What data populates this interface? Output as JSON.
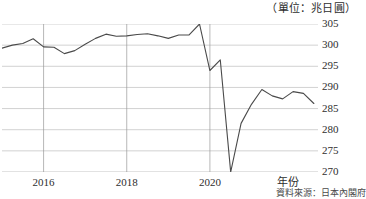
{
  "caption": {
    "unit": "（單位：兆日圓）",
    "source": "資料來源：日本內閣府"
  },
  "axis": {
    "x_name": "年份",
    "y_ticks": [
      "305",
      "300",
      "295",
      "290",
      "285",
      "280",
      "275",
      "270"
    ],
    "x_ticks": [
      "2016",
      "2018",
      "2020"
    ]
  },
  "colors": {
    "line": "#4a4a4a",
    "grid": "#bdbdbd",
    "axis": "#9a9a9a",
    "text": "#2e2e2e",
    "background": "#ffffff"
  },
  "chart_data": {
    "type": "line",
    "title": "",
    "subtitle": "",
    "xlabel": "年份",
    "ylabel": "兆日圓",
    "unit": "兆日圓",
    "source": "資料來源：日本內閣府",
    "grid": true,
    "legend": "none",
    "xlim": [
      2015.0,
      2022.6
    ],
    "ylim": [
      270,
      305
    ],
    "ytick_values": [
      270,
      275,
      280,
      285,
      290,
      295,
      300,
      305
    ],
    "xtick_values": [
      2016,
      2018,
      2020
    ],
    "x_tick_labels": [
      "2016",
      "2018",
      "2020"
    ],
    "series": [
      {
        "name": "名目GDP",
        "color": "#4a4a4a",
        "x": [
          2015.0,
          2015.25,
          2015.5,
          2015.75,
          2016.0,
          2016.25,
          2016.5,
          2016.75,
          2017.0,
          2017.25,
          2017.5,
          2017.75,
          2018.0,
          2018.25,
          2018.5,
          2018.75,
          2019.0,
          2019.25,
          2019.5,
          2019.75,
          2020.0,
          2020.25,
          2020.5,
          2020.75,
          2021.0,
          2021.25,
          2021.5,
          2021.75,
          2022.0,
          2022.25,
          2022.5
        ],
        "values": [
          299.3,
          300.0,
          300.4,
          301.5,
          299.6,
          299.5,
          298.0,
          298.7,
          300.2,
          301.6,
          302.6,
          302.1,
          302.2,
          302.5,
          302.7,
          302.2,
          301.6,
          302.4,
          302.4,
          305.0,
          294.0,
          296.5,
          270.0,
          281.5,
          286.0,
          289.5,
          288.0,
          287.3,
          289.0,
          288.6,
          286.2
        ]
      }
    ]
  }
}
